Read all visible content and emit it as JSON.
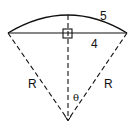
{
  "diagram": {
    "labels": {
      "arc_length": "5",
      "half_chord": "4",
      "radius_left": "R",
      "radius_right": "R",
      "angle": "θ"
    },
    "elements": [
      "arc",
      "chord",
      "two dashed radii",
      "dashed perpendicular bisector",
      "right-angle marker"
    ],
    "colors": {
      "stroke": "#111111",
      "background": "#ffffff"
    }
  }
}
